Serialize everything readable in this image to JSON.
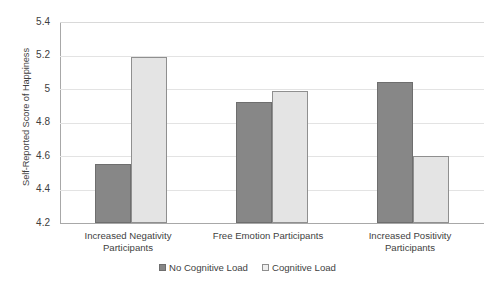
{
  "chart_data": {
    "type": "bar",
    "title": "",
    "xlabel": "",
    "ylabel": "Self-Reported Score of Happiness",
    "ylim": [
      4.2,
      5.4
    ],
    "ytick_step": 0.2,
    "yticks": [
      "5.4",
      "5.2",
      "5",
      "4.8",
      "4.6",
      "4.4",
      "4.2"
    ],
    "grid": true,
    "legend_position": "bottom-center",
    "categories": [
      "Increased Negativity Participants",
      "Free Emotion Participants",
      "Increased Positivity Participants"
    ],
    "category_lines": [
      [
        "Increased Negativity",
        "Participants"
      ],
      [
        "Free Emotion Participants",
        ""
      ],
      [
        "Increased Positivity",
        "Participants"
      ]
    ],
    "series": [
      {
        "name": "No Cognitive Load",
        "color": "#878787",
        "border": "#6e6e6e",
        "values": [
          4.55,
          4.92,
          5.04
        ]
      },
      {
        "name": "Cognitive Load",
        "color": "#e4e4e4",
        "border": "#8f8f8f",
        "values": [
          5.19,
          4.99,
          4.6
        ]
      }
    ]
  },
  "legend": {
    "items": [
      {
        "label": "No Cognitive Load",
        "swatch": "dark"
      },
      {
        "label": "Cognitive Load",
        "swatch": "light"
      }
    ]
  },
  "colors": {
    "no_cognitive_load": "#878787",
    "cognitive_load": "#e4e4e4",
    "gridline": "#e3e3e3",
    "axis": "#a8a8a8",
    "text": "#3f3f3f"
  }
}
